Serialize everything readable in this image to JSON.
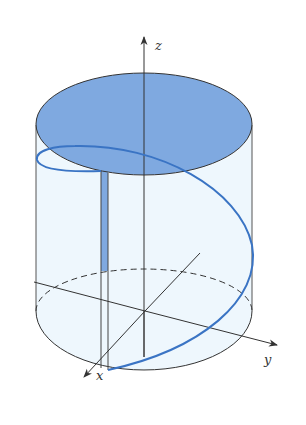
{
  "figure": {
    "labels": {
      "x_axis": "x",
      "y_axis": "y",
      "z_axis": "z"
    },
    "colors": {
      "top_fill": "#7fa9e0",
      "body_fill": "#eef7fd",
      "helix": "#3a74c4",
      "strip_fill": "#7fa9e0",
      "line": "#333333"
    }
  }
}
